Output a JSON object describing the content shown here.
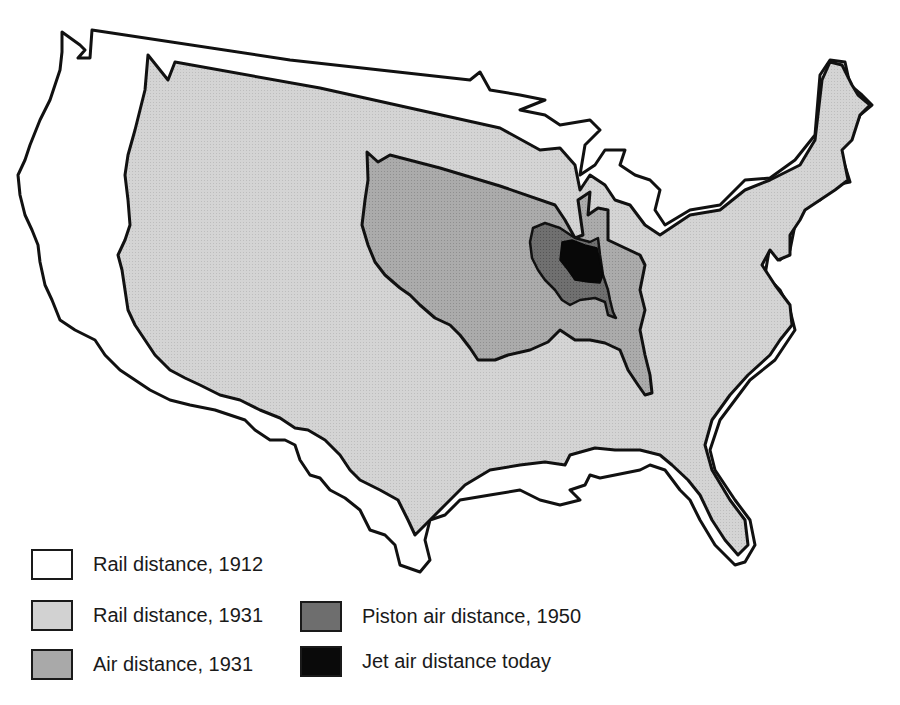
{
  "colors": {
    "rail_1912": "#ffffff",
    "rail_1931": "#d2d2d2",
    "air_1931": "#a9a9a9",
    "piston_1950": "#6e6e6e",
    "jet_today": "#0a0a0a",
    "outline": "#111111"
  },
  "legend": [
    {
      "key": "rail_1912",
      "label": "Rail distance, 1912"
    },
    {
      "key": "rail_1931",
      "label": "Rail distance, 1931"
    },
    {
      "key": "air_1931",
      "label": "Air distance, 1931"
    },
    {
      "key": "piston_1950",
      "label": "Piston air distance, 1950"
    },
    {
      "key": "jet_today",
      "label": "Jet air distance today"
    }
  ],
  "regions": [
    {
      "name": "rail-1912-outline",
      "label": "Rail distance, 1912"
    },
    {
      "name": "rail-1931-outline",
      "label": "Rail distance, 1931"
    },
    {
      "name": "air-1931-outline",
      "label": "Air distance, 1931"
    },
    {
      "name": "piston-1950-outline",
      "label": "Piston air distance, 1950"
    },
    {
      "name": "jet-today-outline",
      "label": "Jet air distance today"
    }
  ]
}
